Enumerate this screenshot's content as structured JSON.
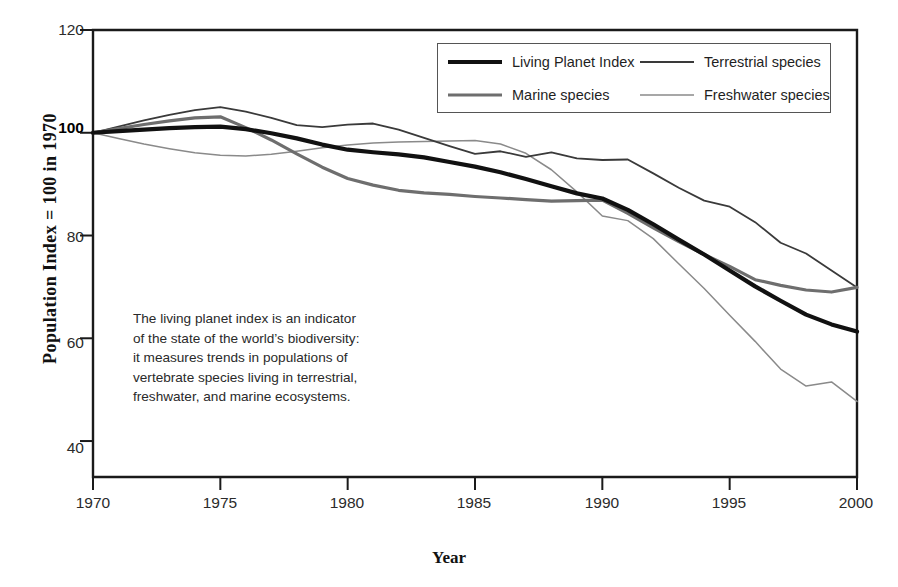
{
  "chart_data": {
    "type": "line",
    "title": "",
    "xlabel": "Year",
    "ylabel": "Population Index = 100 in 1970",
    "xlim": [
      1970,
      2000
    ],
    "ylim": [
      33,
      120
    ],
    "xticks": [
      1970,
      1975,
      1980,
      1985,
      1990,
      1995,
      2000
    ],
    "yticks": [
      40,
      60,
      80,
      100,
      120
    ],
    "ytick_bold": [
      100
    ],
    "grid": false,
    "legend_position": "top-right",
    "x": [
      1970,
      1971,
      1972,
      1973,
      1974,
      1975,
      1976,
      1977,
      1978,
      1979,
      1980,
      1981,
      1982,
      1983,
      1984,
      1985,
      1986,
      1987,
      1988,
      1989,
      1990,
      1991,
      1992,
      1993,
      1994,
      1995,
      1996,
      1997,
      1998,
      1999,
      2000
    ],
    "series": [
      {
        "name": "Living Planet Index",
        "color": "#111111",
        "width": 4.2,
        "values": [
          100,
          100.3,
          100.6,
          100.9,
          101.1,
          101.2,
          100.7,
          99.9,
          98.9,
          97.7,
          96.7,
          96.2,
          95.8,
          95.2,
          94.3,
          93.4,
          92.3,
          91.0,
          89.6,
          88.2,
          87.2,
          85.0,
          82.2,
          79.2,
          76.3,
          73.2,
          70.1,
          67.3,
          64.6,
          62.7,
          61.3
        ]
      },
      {
        "name": "Terrestrial species",
        "color": "#3a3a3a",
        "width": 1.8,
        "values": [
          100,
          101.2,
          102.4,
          103.5,
          104.4,
          105.0,
          104.1,
          102.9,
          101.5,
          101.1,
          101.6,
          101.8,
          100.6,
          99.0,
          97.4,
          95.9,
          96.4,
          95.3,
          96.2,
          95.0,
          94.7,
          94.8,
          92.1,
          89.3,
          86.8,
          85.6,
          82.6,
          78.6,
          76.5,
          73.2,
          69.9
        ]
      },
      {
        "name": "Marine species",
        "color": "#6e6e6e",
        "width": 3.2,
        "values": [
          100,
          100.8,
          101.6,
          102.3,
          102.9,
          103.1,
          101.0,
          98.6,
          95.9,
          93.3,
          91.1,
          89.8,
          88.8,
          88.3,
          88.0,
          87.6,
          87.3,
          87.0,
          86.7,
          86.8,
          86.9,
          84.3,
          81.5,
          78.8,
          76.3,
          74.0,
          71.4,
          70.3,
          69.4,
          69.0,
          69.9
        ]
      },
      {
        "name": "Freshwater species",
        "color": "#8a8a8a",
        "width": 1.5,
        "values": [
          100,
          98.9,
          97.8,
          96.9,
          96.1,
          95.6,
          95.5,
          95.8,
          96.4,
          97.1,
          97.6,
          98.0,
          98.2,
          98.3,
          98.4,
          98.5,
          97.8,
          96.0,
          92.8,
          88.5,
          83.8,
          82.9,
          79.4,
          74.5,
          69.7,
          64.5,
          59.4,
          54.0,
          50.7,
          51.5,
          47.7
        ]
      }
    ]
  },
  "axes": {
    "y_title": "Population Index = 100 in 1970",
    "x_title": "Year",
    "y_tick_labels": [
      "120",
      "100",
      "80",
      "60",
      "40"
    ],
    "x_tick_labels": [
      "1970",
      "1975",
      "1980",
      "1985",
      "1990",
      "1995",
      "2000"
    ]
  },
  "legend": {
    "entries": [
      {
        "label": "Living Planet Index"
      },
      {
        "label": "Terrestrial species"
      },
      {
        "label": "Marine species"
      },
      {
        "label": "Freshwater species"
      }
    ]
  },
  "annotation": {
    "lines": [
      "The living planet index is an indicator",
      "of the state of the world’s biodiversity:",
      "it measures trends in populations of",
      "vertebrate species living in terrestrial,",
      "freshwater, and marine ecosystems."
    ]
  }
}
